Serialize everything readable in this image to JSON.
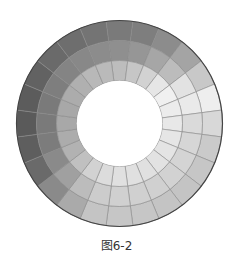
{
  "figure": {
    "caption": "图6-2"
  },
  "wheel": {
    "center": [
      119.5,
      123.5
    ],
    "radii": [
      103,
      83,
      63,
      43
    ],
    "segment_count": 24,
    "start_angle_deg": -7.5,
    "outline_color": "#444444",
    "divider_color": "#8a8a8a",
    "rings": [
      {
        "name": "outer",
        "grays": [
          "#7a7a7a",
          "#7e7e7e",
          "#8c8c8c",
          "#a4a4a4",
          "#c8c8c8",
          "#eeeeee",
          "#d8d8d8",
          "#cacaca",
          "#c6c6c6",
          "#c4c4c4",
          "#c4c4c4",
          "#c6c6c6",
          "#c6c6c6",
          "#c4c4c4",
          "#aaaaaa",
          "#8a8a8a",
          "#6a6a6a",
          "#5e5e5e",
          "#5a5a5a",
          "#5c5c5c",
          "#626262",
          "#6a6a6a",
          "#6e6e6e",
          "#747474"
        ]
      },
      {
        "name": "middle",
        "grays": [
          "#8f8f8f",
          "#969696",
          "#a6a6a6",
          "#bcbcbc",
          "#e2e2e2",
          "#eaeaea",
          "#dadada",
          "#d6d6d6",
          "#d4d4d4",
          "#d2d2d2",
          "#d0d0d0",
          "#d0d0d0",
          "#d0d0d0",
          "#cccccc",
          "#bcbcbc",
          "#a0a0a0",
          "#8a8a8a",
          "#7c7c7c",
          "#7a7a7a",
          "#7a7a7a",
          "#7e7e7e",
          "#848484",
          "#888888",
          "#8c8c8c"
        ]
      },
      {
        "name": "inner",
        "grays": [
          "#bdbdbd",
          "#c6c6c6",
          "#d2d2d2",
          "#e6e6e6",
          "#f0f0f0",
          "#ececec",
          "#e8e8e8",
          "#e6e6e6",
          "#e4e4e4",
          "#e2e2e2",
          "#e0e0e0",
          "#e0e0e0",
          "#e0e0e0",
          "#dcdcdc",
          "#d2d2d2",
          "#c0c0c0",
          "#b2b2b2",
          "#acacac",
          "#a8a8a8",
          "#a8a8a8",
          "#acacac",
          "#b0b0b0",
          "#b8b8b8",
          "#bababa"
        ]
      }
    ]
  }
}
